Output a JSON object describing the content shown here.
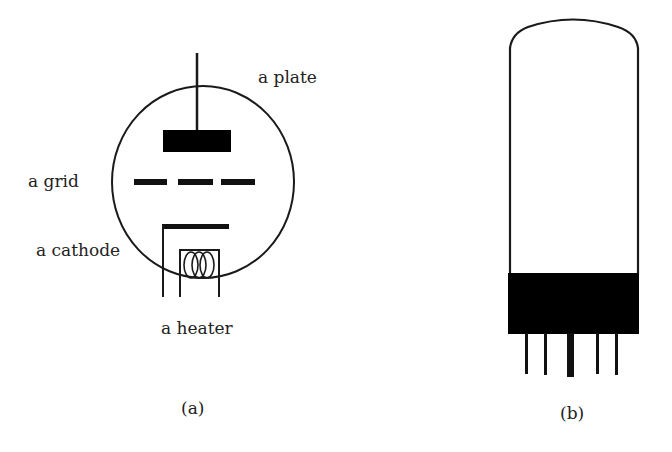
{
  "figure": {
    "panel_a": {
      "caption": "(a)",
      "labels": {
        "plate": "a plate",
        "grid": "a grid",
        "cathode": "a cathode",
        "heater": "a heater"
      }
    },
    "panel_b": {
      "caption": "(b)"
    }
  },
  "colors": {
    "stroke": "#1a1a1a",
    "fill": "#000000",
    "text": "#222222",
    "background": "#ffffff"
  }
}
